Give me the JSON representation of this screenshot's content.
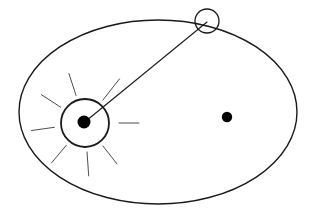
{
  "figure": {
    "background_color": "#ffffff",
    "canvas": {
      "width": 315,
      "height": 218
    }
  },
  "colors": {
    "outline": "#1a1a1a",
    "ray": "#4d4d4d",
    "fill_dot": "#000000"
  },
  "chart_data": {
    "type": "scatter",
    "title": "",
    "xlabel": "",
    "ylabel": "",
    "grid": false,
    "legend": "none",
    "xlim": [
      0,
      315
    ],
    "ylim": [
      0,
      218
    ],
    "elements": [
      {
        "name": "orbit-ellipse",
        "kind": "ellipse",
        "cx": 158,
        "cy": 112,
        "rx": 139,
        "ry": 92,
        "stroke_width": 1.4,
        "fill": "none"
      },
      {
        "name": "sun-outer-circle",
        "kind": "circle",
        "cx": 85,
        "cy": 123,
        "r": 24,
        "stroke_width": 1.8,
        "fill": "none"
      },
      {
        "name": "sun-core-dot",
        "kind": "dot",
        "cx": 84,
        "cy": 122,
        "r": 6.5
      },
      {
        "name": "second-focus-dot",
        "kind": "dot",
        "cx": 227,
        "cy": 117,
        "r": 5.2
      },
      {
        "name": "orbiting-body-circle",
        "kind": "circle",
        "cx": 207,
        "cy": 21,
        "r": 12,
        "stroke_width": 1.3,
        "fill": "none"
      },
      {
        "name": "radius-vector-line",
        "kind": "line",
        "x1": 86,
        "y1": 121,
        "x2": 207,
        "y2": 22,
        "stroke_width": 1.1
      }
    ],
    "sun_rays": [
      {
        "name": "ray-up-left",
        "angle_deg": -108,
        "inner_r": 29,
        "outer_r": 52
      },
      {
        "name": "ray-up-right-short",
        "angle_deg": -52,
        "inner_r": 29,
        "outer_r": 56
      },
      {
        "name": "ray-right",
        "angle_deg": 0,
        "inner_r": 34,
        "outer_r": 54
      },
      {
        "name": "ray-down-right",
        "angle_deg": 52,
        "inner_r": 29,
        "outer_r": 52
      },
      {
        "name": "ray-down",
        "angle_deg": 86,
        "inner_r": 29,
        "outer_r": 53
      },
      {
        "name": "ray-down-left",
        "angle_deg": 130,
        "inner_r": 29,
        "outer_r": 52
      },
      {
        "name": "ray-left",
        "angle_deg": 172,
        "inner_r": 31,
        "outer_r": 54
      },
      {
        "name": "ray-up-left-upper",
        "angle_deg": -147,
        "inner_r": 29,
        "outer_r": 52
      }
    ]
  }
}
